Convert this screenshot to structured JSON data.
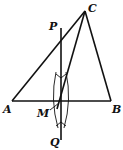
{
  "diagram": {
    "type": "geometry-construction",
    "points": {
      "A": {
        "label": "A",
        "x": 12,
        "y": 101
      },
      "B": {
        "label": "B",
        "x": 111,
        "y": 101
      },
      "C": {
        "label": "C",
        "x": 85,
        "y": 11
      },
      "P": {
        "label": "P",
        "x": 61,
        "y": 28
      },
      "M": {
        "label": "M",
        "x": 61,
        "y": 101
      },
      "Q": {
        "label": "Q",
        "x": 61,
        "y": 140
      }
    },
    "segments": [
      "AB",
      "BC",
      "CA",
      "CM",
      "PQ"
    ],
    "stroke_color": "#111111"
  }
}
